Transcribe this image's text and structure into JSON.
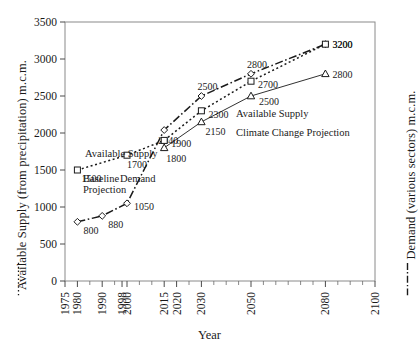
{
  "chart_data": {
    "type": "line",
    "title": "",
    "xlabel": "Year",
    "ylabel_left": "Available Supply (from precipitation) m.c.m.",
    "ylabel_right": "Demand (various sectors) m.c.m.",
    "ylabel_left_line_style": "dotted",
    "ylabel_right_line_style": "dash-dot",
    "xlim": [
      1975,
      2100
    ],
    "ylim": [
      0,
      3500
    ],
    "grid": false,
    "legend_position": "inline-annotations",
    "x_tick_labels": [
      "1975",
      "1980",
      "1990",
      "1998",
      "2000",
      "2015",
      "2020",
      "2030",
      "2050",
      "2080",
      "2100"
    ],
    "x_tick_values": [
      1975,
      1980,
      1990,
      1998,
      2000,
      2015,
      2020,
      2030,
      2050,
      2080,
      2100
    ],
    "x_minor_tick_values": [
      1985,
      1995,
      2005,
      2010,
      2025,
      2035,
      2040,
      2045,
      2055,
      2060,
      2065,
      2070,
      2075,
      2085,
      2090,
      2095
    ],
    "y_tick_labels": [
      "0",
      "500",
      "1000",
      "1500",
      "2000",
      "2500",
      "3000",
      "3500"
    ],
    "y_tick_values": [
      0,
      500,
      1000,
      1500,
      2000,
      2500,
      3000,
      3500
    ],
    "series": [
      {
        "name": "Demand",
        "marker": "diamond",
        "line_style": "dash-dot",
        "color": "#1a1a1a",
        "axis": "right",
        "x": [
          1980,
          1990,
          2000,
          2015,
          2030,
          2050,
          2080
        ],
        "values": [
          800,
          880,
          1050,
          2040,
          2500,
          2800,
          3200
        ],
        "point_labels": [
          "800",
          "880",
          "1050",
          "2040",
          "2500",
          "2800",
          "3200"
        ]
      },
      {
        "name": "Available Supply Baseline Projection",
        "marker": "square",
        "line_style": "dotted",
        "color": "#1a1a1a",
        "axis": "left",
        "x": [
          1980,
          2000,
          2015,
          2030,
          2050,
          2080
        ],
        "values": [
          1500,
          1700,
          1900,
          2300,
          2700,
          3200
        ],
        "point_labels": [
          "1500",
          "1700",
          "1900",
          "2300",
          "2700",
          "3200"
        ]
      },
      {
        "name": "Available Supply Climate Change Projection",
        "marker": "triangle",
        "line_style": "solid",
        "color": "#1a1a1a",
        "axis": "left",
        "x": [
          2015,
          2030,
          2050,
          2080
        ],
        "values": [
          1800,
          2150,
          2500,
          2800
        ],
        "point_labels": [
          "1800",
          "2150",
          "2500",
          "2800"
        ]
      }
    ],
    "annotations": [
      {
        "text": "Available Supply",
        "x": 85,
        "y": 157
      },
      {
        "text": "Baseline",
        "x": 83,
        "y": 182
      },
      {
        "text": "Projection",
        "x": 83,
        "y": 193
      },
      {
        "text": "Demand",
        "x": 120,
        "y": 182
      },
      {
        "text": "Available Supply",
        "x": 236,
        "y": 117
      },
      {
        "text": "Climate Change Projection",
        "x": 236,
        "y": 136
      }
    ]
  }
}
